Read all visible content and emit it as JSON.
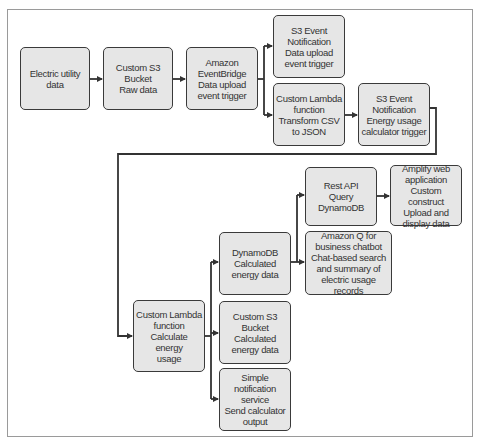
{
  "diagram": {
    "nodes": [
      {
        "id": "electric_utility",
        "label": "Electric utility\ndata"
      },
      {
        "id": "s3_raw",
        "label": "Custom S3\nBucket\nRaw data"
      },
      {
        "id": "eventbridge",
        "label": "Amazon\nEventBridge\nData upload\nevent trigger"
      },
      {
        "id": "s3_event_upload",
        "label": "S3 Event\nNotification\nData upload\nevent trigger"
      },
      {
        "id": "lambda_transform",
        "label": "Custom Lambda\nfunction\nTransform CSV\nto JSON"
      },
      {
        "id": "s3_event_energy",
        "label": "S3 Event\nNotification\nEnergy usage\ncalculator trigger"
      },
      {
        "id": "lambda_calc",
        "label": "Custom Lambda\nfunction\nCalculate energy\nusage"
      },
      {
        "id": "dynamodb",
        "label": "DynamoDB\nCalculated\nenergy data"
      },
      {
        "id": "s3_calc",
        "label": "Custom S3 Bucket\nCalculated\nenergy data"
      },
      {
        "id": "sns",
        "label": "Simple\nnotification\nservice\nSend calculator\noutput"
      },
      {
        "id": "rest_api",
        "label": "Rest API\nQuery\nDynamoDB"
      },
      {
        "id": "amazon_q",
        "label": "Amazon Q for\nbusiness chatbot\nChat-based search\nand summary of\nelectric usage records"
      },
      {
        "id": "amplify",
        "label": "Amplify web\napplication\nCustom construct\nUpload and\ndisplay data"
      }
    ],
    "edges": [
      [
        "electric_utility",
        "s3_raw"
      ],
      [
        "s3_raw",
        "eventbridge"
      ],
      [
        "eventbridge",
        "s3_event_upload"
      ],
      [
        "eventbridge",
        "lambda_transform"
      ],
      [
        "lambda_transform",
        "s3_event_energy"
      ],
      [
        "s3_event_energy",
        "lambda_calc"
      ],
      [
        "lambda_calc",
        "dynamodb"
      ],
      [
        "lambda_calc",
        "s3_calc"
      ],
      [
        "lambda_calc",
        "sns"
      ],
      [
        "dynamodb",
        "rest_api"
      ],
      [
        "dynamodb",
        "amazon_q"
      ],
      [
        "rest_api",
        "amplify"
      ]
    ],
    "colors": {
      "box_fill": "#e6e6e6",
      "box_border": "#3a3a3a",
      "line": "#333333",
      "frame": "#9a9a9a"
    }
  }
}
